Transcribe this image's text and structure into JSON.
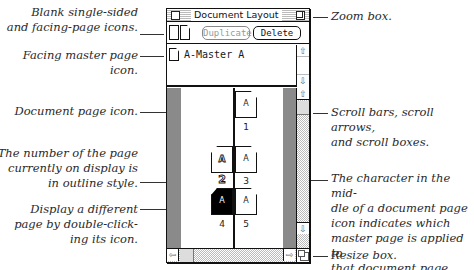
{
  "window": {
    "title": "Document Layout",
    "toolbar": {
      "duplicate_label": "Duplicate",
      "duplicate_enabled": false,
      "delete_label": "Delete"
    },
    "masters": [
      {
        "label": "A-Master A",
        "icon": "facing-master-page-icon"
      }
    ],
    "pages": [
      {
        "number": "1",
        "master_char": "A",
        "side": "right",
        "selected": false,
        "current": false
      },
      {
        "number": "2",
        "master_char": "A",
        "side": "left",
        "selected": false,
        "current": true
      },
      {
        "number": "3",
        "master_char": "A",
        "side": "right",
        "selected": false,
        "current": false
      },
      {
        "number": "4",
        "master_char": "A",
        "side": "left",
        "selected": true,
        "current": false
      },
      {
        "number": "5",
        "master_char": "A",
        "side": "right",
        "selected": false,
        "current": false
      }
    ],
    "icons": {
      "close_box": "close-box-icon",
      "zoom_box": "zoom-box-icon",
      "scroll_up": "⇧",
      "scroll_down": "⇩",
      "scroll_left": "⇦",
      "scroll_right": "⇨",
      "resize": "resize-box-icon"
    }
  },
  "callouts": {
    "left": [
      "Blank single-sided\nand facing-page icons.",
      "Facing master page\nicon.",
      "Document page icon.",
      "The number of the page\ncurrently on display is\nin outline style.",
      "Display a different\npage by double-click-\ning its icon."
    ],
    "right": [
      "Zoom box.",
      "Scroll bars, scroll arrows,\nand scroll boxes.",
      "The character in the mid-\ndle of a document page\nicon indicates which\nmaster page is applied to\nthat document page.",
      "Resize box."
    ]
  }
}
